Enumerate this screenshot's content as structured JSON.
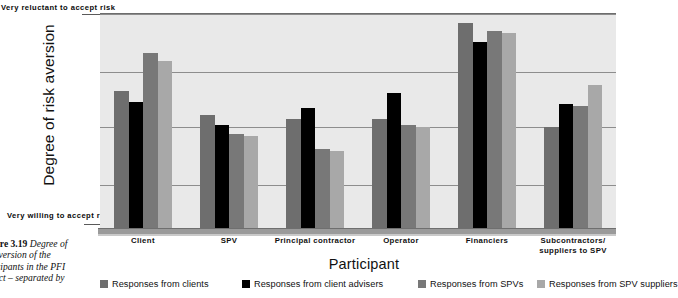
{
  "axis": {
    "y_title": "Degree of risk aversion",
    "y_top_label": "Very reluctant to accept risk",
    "y_bottom_label": "Very willing to accept risk",
    "x_title": "Participant"
  },
  "caption": {
    "figure_number": "igure 3.19",
    "line1": " Degree of",
    "line2": "k aversion of the",
    "line3": "rticipants in the PFI",
    "line4": "oject – separated by"
  },
  "legend": {
    "items": [
      {
        "label": "Responses from clients",
        "color": "#6e6e6e"
      },
      {
        "label": "Responses from client advisers",
        "color": "#000000"
      },
      {
        "label": "Responses from SPVs",
        "color": "#787878"
      },
      {
        "label": "Responses from SPV suppliers",
        "color": "#a8a8a8"
      }
    ]
  },
  "chart_data": {
    "type": "bar",
    "xlabel": "Participant",
    "ylabel": "Degree of risk aversion",
    "ylim": [
      0,
      100
    ],
    "y_axis_endpoints": {
      "top": "Very reluctant to accept risk",
      "bottom": "Very willing to accept risk"
    },
    "grid": true,
    "gridline_values": [
      100,
      73,
      47,
      20
    ],
    "legend_position": "bottom",
    "categories": [
      "Client",
      "SPV",
      "Principal contractor",
      "Operator",
      "Financiers",
      "Subcontractors/ suppliers to SPV"
    ],
    "category_lines": [
      [
        "Client"
      ],
      [
        "SPV"
      ],
      [
        "Principal contractor"
      ],
      [
        "Operator"
      ],
      [
        "Financiers"
      ],
      [
        "Subcontractors/",
        "suppliers to SPV"
      ]
    ],
    "series": [
      {
        "name": "Responses from clients",
        "color": "#6e6e6e",
        "values": [
          64,
          53,
          51,
          51,
          96,
          47
        ]
      },
      {
        "name": "Responses from client advisers",
        "color": "#000000",
        "values": [
          59,
          48,
          56,
          63,
          87,
          58
        ]
      },
      {
        "name": "Responses from SPVs",
        "color": "#787878",
        "values": [
          82,
          44,
          37,
          48,
          92,
          57
        ]
      },
      {
        "name": "Responses from SPV suppliers",
        "color": "#a8a8a8",
        "values": [
          78,
          43,
          36,
          47,
          91,
          67
        ]
      }
    ]
  },
  "style": {
    "plot_background": "#e9e9e9",
    "gridline_color": "#8d8d8d",
    "axis_color": "#9a9a9a"
  }
}
